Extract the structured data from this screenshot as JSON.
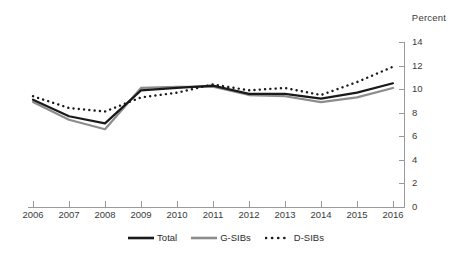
{
  "chart_data": {
    "type": "line",
    "title": "",
    "subtitle": "",
    "xlabel": "",
    "ylabel": "Percent",
    "axis_unit_label": "Percent",
    "x": [
      2006,
      2007,
      2008,
      2009,
      2010,
      2011,
      2012,
      2013,
      2014,
      2015,
      2016
    ],
    "categories": [
      "2006",
      "2007",
      "2008",
      "2009",
      "2010",
      "2011",
      "2012",
      "2013",
      "2014",
      "2015",
      "2016"
    ],
    "xlim": [
      2006,
      2016
    ],
    "ylim": [
      0,
      14
    ],
    "yticks": [
      0,
      2,
      4,
      6,
      8,
      10,
      12,
      14
    ],
    "ytick_labels": [
      "0",
      "2",
      "4",
      "6",
      "8",
      "10",
      "12",
      "14"
    ],
    "grid": false,
    "legend_position": "bottom",
    "series": [
      {
        "name": "Total",
        "style": "solid",
        "color": "#1a1a1a",
        "width": 2.2,
        "values": [
          9.1,
          7.7,
          7.1,
          9.9,
          10.1,
          10.3,
          9.6,
          9.6,
          9.2,
          9.7,
          10.5
        ]
      },
      {
        "name": "G-SIBs",
        "style": "solid",
        "color": "#8c8c8c",
        "width": 2.2,
        "values": [
          8.9,
          7.4,
          6.6,
          10.1,
          10.2,
          10.2,
          9.5,
          9.4,
          8.9,
          9.3,
          10.1
        ]
      },
      {
        "name": "D-SIBs",
        "style": "dotted",
        "color": "#1a1a1a",
        "width": 2.2,
        "values": [
          9.4,
          8.4,
          8.1,
          9.3,
          9.7,
          10.4,
          9.9,
          10.1,
          9.5,
          10.6,
          11.9
        ]
      }
    ]
  },
  "legend": {
    "items": [
      {
        "label": "Total",
        "swatch": "solid-black-line-icon"
      },
      {
        "label": "G-SIBs",
        "swatch": "solid-gray-line-icon"
      },
      {
        "label": "D-SIBs",
        "swatch": "dotted-black-line-icon"
      }
    ]
  },
  "colors": {
    "total": "#1a1a1a",
    "gsibs": "#8c8c8c",
    "dsibs": "#1a1a1a",
    "axis": "#9a9a9a",
    "text": "#2b2b2b",
    "background": "#ffffff"
  }
}
